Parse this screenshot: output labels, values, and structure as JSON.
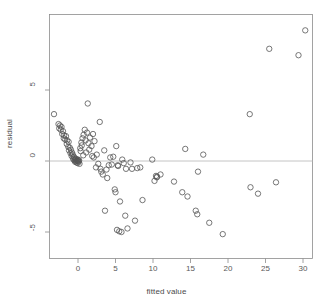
{
  "chart_data": {
    "type": "scatter",
    "title": "",
    "xlabel": "fitted value",
    "ylabel": "residual",
    "xlim": [
      -3.9,
      31.5
    ],
    "ylim": [
      -5.9,
      9.8
    ],
    "xticks": [
      0,
      5,
      10,
      15,
      20,
      25,
      30
    ],
    "xtick_labels": [
      "0",
      "5",
      "10",
      "15",
      "20",
      "25",
      "30"
    ],
    "yticks": [
      5,
      0,
      -5
    ],
    "ytick_labels": [
      "5",
      "0",
      "-5"
    ],
    "grid": false,
    "legend": null,
    "reference_lines": [
      {
        "orientation": "horizontal",
        "y": 0,
        "color": "#bdbdbd"
      }
    ],
    "marker": {
      "shape": "open-circle",
      "radius_px": 2.7,
      "stroke": "#555555",
      "fill": "none",
      "stroke_width": 0.8
    },
    "n_points": 112,
    "points": [
      [
        -3.2,
        3.3
      ],
      [
        -2.6,
        2.6
      ],
      [
        -2.5,
        2.3
      ],
      [
        -2.4,
        2.5
      ],
      [
        -2.3,
        2.2
      ],
      [
        -2.2,
        2.4
      ],
      [
        -2.1,
        1.9
      ],
      [
        -2.0,
        2.1
      ],
      [
        -1.9,
        1.6
      ],
      [
        -1.85,
        1.8
      ],
      [
        -1.7,
        1.5
      ],
      [
        -1.6,
        1.75
      ],
      [
        -1.5,
        1.2
      ],
      [
        -1.45,
        1.45
      ],
      [
        -1.3,
        1.0
      ],
      [
        -1.25,
        1.35
      ],
      [
        -1.2,
        0.75
      ],
      [
        -1.1,
        0.95
      ],
      [
        -1.0,
        0.55
      ],
      [
        -0.95,
        0.8
      ],
      [
        -0.85,
        0.35
      ],
      [
        -0.8,
        0.6
      ],
      [
        -0.7,
        0.45
      ],
      [
        -0.65,
        0.15
      ],
      [
        -0.55,
        0.3
      ],
      [
        -0.5,
        0.05
      ],
      [
        -0.45,
        0.2
      ],
      [
        -0.4,
        -0.05
      ],
      [
        -0.35,
        0.1
      ],
      [
        -0.3,
        0.0
      ],
      [
        -0.25,
        0.15
      ],
      [
        -0.2,
        -0.1
      ],
      [
        -0.15,
        0.05
      ],
      [
        -0.1,
        0.0
      ],
      [
        -0.05,
        -0.15
      ],
      [
        0.0,
        0.1
      ],
      [
        0.05,
        0.0
      ],
      [
        0.1,
        -0.05
      ],
      [
        0.15,
        0.05
      ],
      [
        0.2,
        -0.2
      ],
      [
        0.3,
        0.9
      ],
      [
        0.35,
        0.7
      ],
      [
        0.45,
        1.3
      ],
      [
        0.5,
        1.1
      ],
      [
        0.6,
        1.6
      ],
      [
        0.7,
        0.4
      ],
      [
        0.75,
        1.85
      ],
      [
        0.9,
        2.2
      ],
      [
        1.0,
        1.45
      ],
      [
        1.1,
        0.6
      ],
      [
        1.2,
        2.0
      ],
      [
        1.3,
        4.05
      ],
      [
        1.4,
        1.25
      ],
      [
        1.5,
        0.8
      ],
      [
        1.6,
        1.65
      ],
      [
        1.8,
        1.05
      ],
      [
        1.9,
        0.35
      ],
      [
        2.0,
        1.9
      ],
      [
        2.1,
        0.25
      ],
      [
        2.2,
        1.4
      ],
      [
        2.4,
        -0.45
      ],
      [
        2.5,
        0.45
      ],
      [
        2.7,
        -0.2
      ],
      [
        2.9,
        2.75
      ],
      [
        3.0,
        -0.55
      ],
      [
        3.1,
        -0.75
      ],
      [
        3.3,
        -0.95
      ],
      [
        3.5,
        0.75
      ],
      [
        3.6,
        -3.5
      ],
      [
        3.8,
        -0.6
      ],
      [
        3.9,
        -1.2
      ],
      [
        4.1,
        -0.3
      ],
      [
        4.3,
        0.25
      ],
      [
        4.5,
        -0.25
      ],
      [
        4.7,
        0.3
      ],
      [
        4.9,
        -2.0
      ],
      [
        5.0,
        -2.2
      ],
      [
        5.1,
        1.05
      ],
      [
        5.2,
        -4.85
      ],
      [
        5.3,
        -0.3
      ],
      [
        5.35,
        -0.35
      ],
      [
        5.5,
        -4.95
      ],
      [
        5.6,
        -2.85
      ],
      [
        5.8,
        -5.0
      ],
      [
        5.9,
        0.1
      ],
      [
        6.1,
        -0.15
      ],
      [
        6.3,
        -3.85
      ],
      [
        6.4,
        -0.55
      ],
      [
        6.6,
        -4.75
      ],
      [
        7.0,
        -0.1
      ],
      [
        7.2,
        -0.55
      ],
      [
        7.6,
        -4.2
      ],
      [
        7.9,
        -0.5
      ],
      [
        8.3,
        -0.45
      ],
      [
        8.6,
        -2.75
      ],
      [
        9.9,
        0.1
      ],
      [
        10.2,
        -1.4
      ],
      [
        10.4,
        -1.05
      ],
      [
        10.5,
        -1.15
      ],
      [
        10.55,
        -1.1
      ],
      [
        11.0,
        -0.95
      ],
      [
        12.8,
        -1.45
      ],
      [
        13.9,
        -2.2
      ],
      [
        14.3,
        0.85
      ],
      [
        14.6,
        -2.5
      ],
      [
        15.7,
        -3.5
      ],
      [
        15.9,
        -3.75
      ],
      [
        16.0,
        -0.75
      ],
      [
        16.7,
        0.45
      ],
      [
        17.5,
        -4.35
      ],
      [
        19.3,
        -5.15
      ],
      [
        22.9,
        3.3
      ],
      [
        23.0,
        -1.85
      ],
      [
        24.0,
        -2.3
      ],
      [
        25.5,
        7.9
      ],
      [
        26.4,
        -1.5
      ],
      [
        29.4,
        7.45
      ],
      [
        30.3,
        9.2
      ]
    ]
  },
  "figure": {
    "background_color": "#ffffff",
    "plot_border_color": "#8c8c8c",
    "tick_color": "#8c8c8c",
    "text_color": "#595959"
  }
}
